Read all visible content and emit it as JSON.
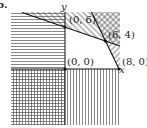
{
  "figure": {
    "part_label": "b.",
    "axes": {
      "x_label": "x",
      "y_label": "y"
    },
    "points": [
      {
        "label": "(0, 0)",
        "x": 0,
        "y": 0
      },
      {
        "label": "(0, 6)",
        "x": 0,
        "y": 6
      },
      {
        "label": "(6, 4)",
        "x": 6,
        "y": 4
      },
      {
        "label": "(8, 0)",
        "x": 8,
        "y": 0
      }
    ],
    "boundary_lines": [
      {
        "through": [
          "(0, 6)",
          "(6, 4)"
        ]
      },
      {
        "through": [
          "(6, 4)",
          "(8, 0)"
        ]
      }
    ],
    "feasible_region": "unshaded quadrilateral with vertices (0, 0), (0, 6), (6, 4), (8, 0)",
    "shading": {
      "x_negative": "horizontal hatch",
      "y_negative": "vertical hatch",
      "above_line_1": "diagonal hatch",
      "above_line_2": "cross-diagonal hatch"
    }
  }
}
